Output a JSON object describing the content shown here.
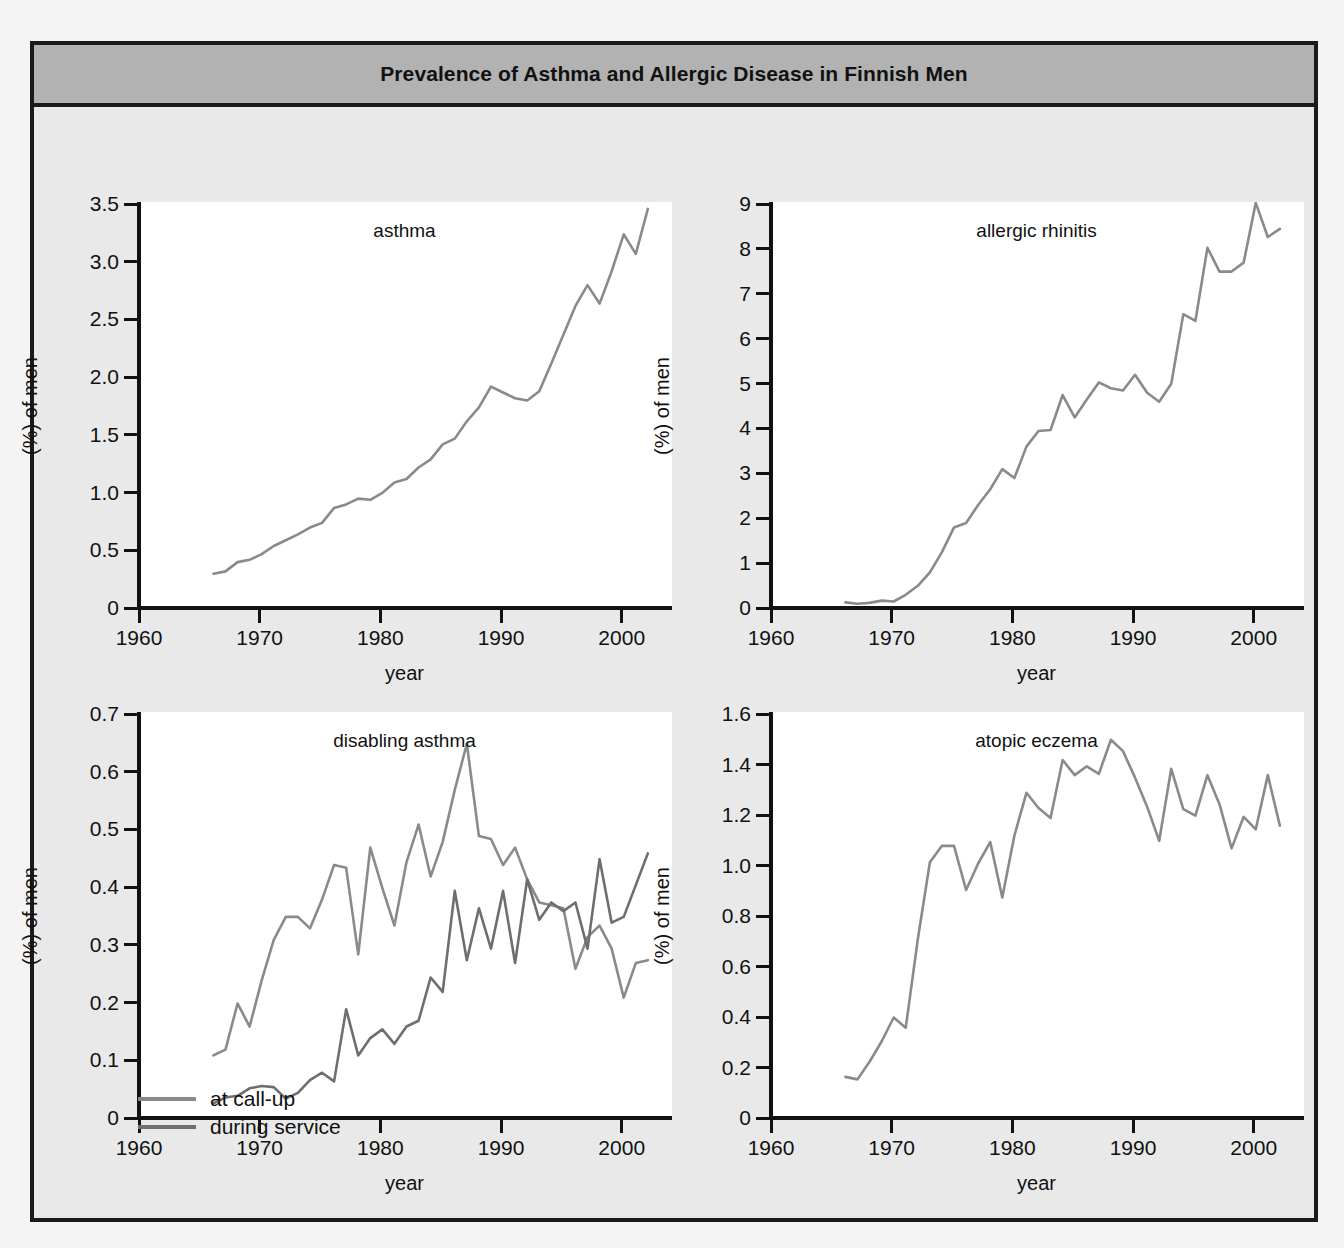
{
  "figure": {
    "title": "Prevalence of Asthma and Allergic Disease in Finnish Men",
    "xlabel": "year",
    "ylabel": "(%) of men"
  },
  "legend": {
    "items": [
      {
        "label": "at call-up",
        "color": "#8a8a8a"
      },
      {
        "label": "during service",
        "color": "#6e6e6e"
      }
    ]
  },
  "colors": {
    "frame_border": "#1a1a1a",
    "title_bar": "#b2b2b2",
    "figure_background": "#e9e9e9",
    "plot_background": "#ffffff",
    "axis": "#111111",
    "series_call_up": "#8a8a8a",
    "series_during_service": "#6e6e6e"
  },
  "chart_data": [
    {
      "type": "line",
      "title": "asthma",
      "xlabel": "year",
      "ylabel": "(%) of men",
      "xlim": [
        1960,
        2004
      ],
      "ylim": [
        0,
        3.5
      ],
      "xticks": [
        1960,
        1970,
        1980,
        1990,
        2000
      ],
      "yticks": [
        0,
        0.5,
        1.0,
        1.5,
        2.0,
        2.5,
        3.0,
        3.5
      ],
      "ytick_labels": [
        "0",
        "0.5",
        "1.0",
        "1.5",
        "2.0",
        "2.5",
        "3.0",
        "3.5"
      ],
      "xtick_labels": [
        "1960",
        "1970",
        "1980",
        "1990",
        "2000"
      ],
      "grid": false,
      "legend": "none",
      "series": [
        {
          "name": "at call-up",
          "color": "#8a8a8a",
          "x": [
            1966,
            1967,
            1968,
            1969,
            1970,
            1971,
            1972,
            1973,
            1974,
            1975,
            1976,
            1977,
            1978,
            1979,
            1980,
            1981,
            1982,
            1983,
            1984,
            1985,
            1986,
            1987,
            1988,
            1989,
            1990,
            1991,
            1992,
            1993,
            1994,
            1995,
            1996,
            1997,
            1998,
            1999,
            2000,
            2001,
            2002
          ],
          "y": [
            0.28,
            0.3,
            0.38,
            0.4,
            0.45,
            0.52,
            0.57,
            0.62,
            0.68,
            0.72,
            0.85,
            0.88,
            0.93,
            0.92,
            0.98,
            1.07,
            1.1,
            1.2,
            1.27,
            1.4,
            1.45,
            1.6,
            1.72,
            1.9,
            1.85,
            1.8,
            1.78,
            1.86,
            2.1,
            2.35,
            2.6,
            2.78,
            2.62,
            2.9,
            3.22,
            3.05,
            3.44
          ]
        }
      ]
    },
    {
      "type": "line",
      "title": "allergic rhinitis",
      "xlabel": "year",
      "ylabel": "(%) of men",
      "xlim": [
        1960,
        2004
      ],
      "ylim": [
        0,
        9
      ],
      "xticks": [
        1960,
        1970,
        1980,
        1990,
        2000
      ],
      "yticks": [
        0,
        1,
        2,
        3,
        4,
        5,
        6,
        7,
        8,
        9
      ],
      "ytick_labels": [
        "0",
        "1",
        "2",
        "3",
        "4",
        "5",
        "6",
        "7",
        "8",
        "9"
      ],
      "xtick_labels": [
        "1960",
        "1970",
        "1980",
        "1990",
        "2000"
      ],
      "grid": false,
      "legend": "none",
      "series": [
        {
          "name": "at call-up",
          "color": "#8a8a8a",
          "x": [
            1966,
            1967,
            1968,
            1969,
            1970,
            1971,
            1972,
            1973,
            1974,
            1975,
            1976,
            1977,
            1978,
            1979,
            1980,
            1981,
            1982,
            1983,
            1984,
            1985,
            1986,
            1987,
            1988,
            1989,
            1990,
            1991,
            1992,
            1993,
            1994,
            1995,
            1996,
            1997,
            1998,
            1999,
            2000,
            2001,
            2002
          ],
          "y": [
            0.08,
            0.05,
            0.07,
            0.12,
            0.1,
            0.25,
            0.45,
            0.75,
            1.2,
            1.75,
            1.85,
            2.25,
            2.6,
            3.05,
            2.85,
            3.55,
            3.9,
            3.92,
            4.7,
            4.2,
            4.6,
            4.98,
            4.85,
            4.8,
            5.15,
            4.75,
            4.55,
            4.95,
            6.5,
            6.35,
            7.98,
            7.45,
            7.45,
            7.65,
            8.98,
            8.22,
            8.4
          ]
        }
      ]
    },
    {
      "type": "line",
      "title": "disabling asthma",
      "xlabel": "year",
      "ylabel": "(%) of men",
      "xlim": [
        1960,
        2004
      ],
      "ylim": [
        0,
        0.7
      ],
      "xticks": [
        1960,
        1970,
        1980,
        1990,
        2000
      ],
      "yticks": [
        0,
        0.1,
        0.2,
        0.3,
        0.4,
        0.5,
        0.6,
        0.7
      ],
      "ytick_labels": [
        "0",
        "0.1",
        "0.2",
        "0.3",
        "0.4",
        "0.5",
        "0.6",
        "0.7"
      ],
      "xtick_labels": [
        "1960",
        "1970",
        "1980",
        "1990",
        "2000"
      ],
      "grid": false,
      "legend": "bottom-left",
      "series": [
        {
          "name": "at call-up",
          "color": "#8a8a8a",
          "x": [
            1966,
            1967,
            1968,
            1969,
            1970,
            1971,
            1972,
            1973,
            1974,
            1975,
            1976,
            1977,
            1978,
            1979,
            1980,
            1981,
            1982,
            1983,
            1984,
            1985,
            1986,
            1987,
            1988,
            1989,
            1990,
            1991,
            1992,
            1993,
            1994,
            1995,
            1996,
            1997,
            1998,
            1999,
            2000,
            2001,
            2002
          ],
          "y": [
            0.105,
            0.115,
            0.195,
            0.155,
            0.235,
            0.305,
            0.345,
            0.345,
            0.325,
            0.375,
            0.435,
            0.43,
            0.28,
            0.465,
            0.395,
            0.33,
            0.44,
            0.505,
            0.415,
            0.475,
            0.565,
            0.645,
            0.485,
            0.48,
            0.435,
            0.465,
            0.41,
            0.37,
            0.365,
            0.36,
            0.255,
            0.31,
            0.33,
            0.29,
            0.205,
            0.265,
            0.27
          ]
        },
        {
          "name": "during service",
          "color": "#6e6e6e",
          "x": [
            1966,
            1967,
            1968,
            1969,
            1970,
            1971,
            1972,
            1973,
            1974,
            1975,
            1976,
            1977,
            1978,
            1979,
            1980,
            1981,
            1982,
            1983,
            1984,
            1985,
            1986,
            1987,
            1988,
            1989,
            1990,
            1991,
            1992,
            1993,
            1994,
            1995,
            1996,
            1997,
            1998,
            1999,
            2000,
            2001,
            2002
          ],
          "y": [
            0.022,
            0.032,
            0.035,
            0.048,
            0.052,
            0.05,
            0.03,
            0.04,
            0.062,
            0.075,
            0.06,
            0.185,
            0.105,
            0.135,
            0.15,
            0.125,
            0.155,
            0.165,
            0.24,
            0.215,
            0.39,
            0.27,
            0.36,
            0.29,
            0.39,
            0.265,
            0.41,
            0.34,
            0.37,
            0.355,
            0.37,
            0.29,
            0.445,
            0.335,
            0.345,
            0.4,
            0.455
          ]
        }
      ]
    },
    {
      "type": "line",
      "title": "atopic eczema",
      "xlabel": "year",
      "ylabel": "(%) of men",
      "xlim": [
        1960,
        2004
      ],
      "ylim": [
        0,
        1.6
      ],
      "xticks": [
        1960,
        1970,
        1980,
        1990,
        2000
      ],
      "yticks": [
        0,
        0.2,
        0.4,
        0.6,
        0.8,
        1.0,
        1.2,
        1.4,
        1.6
      ],
      "ytick_labels": [
        "0",
        "0.2",
        "0.4",
        "0.6",
        "0.8",
        "1.0",
        "1.2",
        "1.4",
        "1.6"
      ],
      "xtick_labels": [
        "1960",
        "1970",
        "1980",
        "1990",
        "2000"
      ],
      "grid": false,
      "legend": "none",
      "series": [
        {
          "name": "at call-up",
          "color": "#8a8a8a",
          "x": [
            1966,
            1967,
            1968,
            1969,
            1970,
            1971,
            1972,
            1973,
            1974,
            1975,
            1976,
            1977,
            1978,
            1979,
            1980,
            1981,
            1982,
            1983,
            1984,
            1985,
            1986,
            1987,
            1988,
            1989,
            1990,
            1991,
            1992,
            1993,
            1994,
            1995,
            1996,
            1997,
            1998,
            1999,
            2000,
            2001,
            2002
          ],
          "y": [
            0.155,
            0.145,
            0.215,
            0.295,
            0.39,
            0.35,
            0.7,
            1.005,
            1.07,
            1.07,
            0.895,
            1.0,
            1.085,
            0.865,
            1.11,
            1.28,
            1.22,
            1.18,
            1.41,
            1.35,
            1.385,
            1.355,
            1.49,
            1.445,
            1.34,
            1.225,
            1.09,
            1.375,
            1.215,
            1.19,
            1.35,
            1.235,
            1.06,
            1.185,
            1.135,
            1.35,
            1.15
          ]
        }
      ]
    }
  ]
}
